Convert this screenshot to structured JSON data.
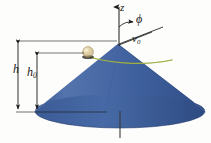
{
  "figure": {
    "type": "physics-diagram",
    "background_color": "#fdfdfb"
  },
  "labels": {
    "z_axis": "z",
    "phi_angle": "ϕ",
    "velocity": "v",
    "velocity_sub": "0",
    "height_total": "h",
    "height_ball": "h",
    "height_ball_sub": "0"
  },
  "colors": {
    "cone_light": "#5b79b4",
    "cone_mid": "#3f5e9e",
    "cone_dark": "#32508c",
    "cone_base_shade": "#2f4b86",
    "ball_fill": "#e3d2a4",
    "ball_shade": "#b39f6d",
    "trajectory": "#7f8f2a",
    "line": "#1a1a1a",
    "text": "#1a1a1a"
  },
  "geometry": {
    "apex": {
      "x": 118,
      "y": 44
    },
    "base_center": {
      "x": 120,
      "y": 112
    },
    "base_rx": 85,
    "base_ry": 17,
    "ball": {
      "x": 88,
      "y": 52,
      "r": 5
    },
    "h_top_y": 41,
    "h_bottom_y": 112,
    "h0_top_y": 53,
    "h0_bottom_y": 112,
    "h_dim_x": 18,
    "h0_dim_x": 37,
    "z_axis_top_y": 4,
    "axis_bottom_y": 138
  },
  "elements": [
    {
      "name": "z-axis",
      "description": "vertical axis with upward arrow through cone apex"
    },
    {
      "name": "phi-angle-arc",
      "description": "angle phi between z-axis and slanted ray"
    },
    {
      "name": "velocity-vector",
      "description": "v0 initial velocity arrow at ball"
    },
    {
      "name": "cone",
      "description": "blue shaded cone, apex up"
    },
    {
      "name": "ball",
      "description": "small tan sphere on cone surface"
    },
    {
      "name": "trajectory",
      "description": "green horizontal circular path of ball on cone"
    },
    {
      "name": "h-dimension",
      "description": "total cone height dimension line"
    },
    {
      "name": "h0-dimension",
      "description": "ball height above base dimension line"
    }
  ]
}
